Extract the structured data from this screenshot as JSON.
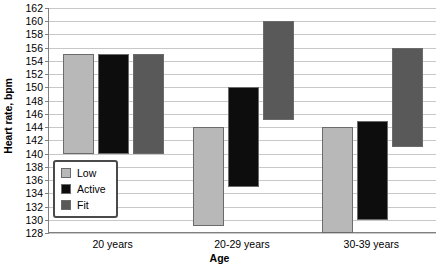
{
  "chart_data": {
    "type": "bar",
    "bar_style": "floating-range",
    "title": "",
    "xlabel": "Age",
    "ylabel": "Heart rate, bpm",
    "ylim": [
      128,
      162
    ],
    "ytick_step": 2,
    "yticks": [
      128,
      130,
      132,
      134,
      136,
      138,
      140,
      142,
      144,
      146,
      148,
      150,
      152,
      154,
      156,
      158,
      160,
      162
    ],
    "grid": true,
    "categories": [
      "20 years",
      "20-29 years",
      "30-39 years"
    ],
    "legend_position": "inside-lower-left",
    "series": [
      {
        "name": "Low",
        "color": "#b8b8b8",
        "low": [
          140,
          129,
          128
        ],
        "high": [
          155,
          144,
          144
        ]
      },
      {
        "name": "Active",
        "color": "#0d0d0d",
        "low": [
          140,
          135,
          130
        ],
        "high": [
          155,
          150,
          145
        ]
      },
      {
        "name": "Fit",
        "color": "#595959",
        "low": [
          140,
          145,
          141
        ],
        "high": [
          155,
          160,
          156
        ]
      }
    ]
  },
  "axis": {
    "y_title": "Heart rate, bpm",
    "x_title": "Age"
  }
}
